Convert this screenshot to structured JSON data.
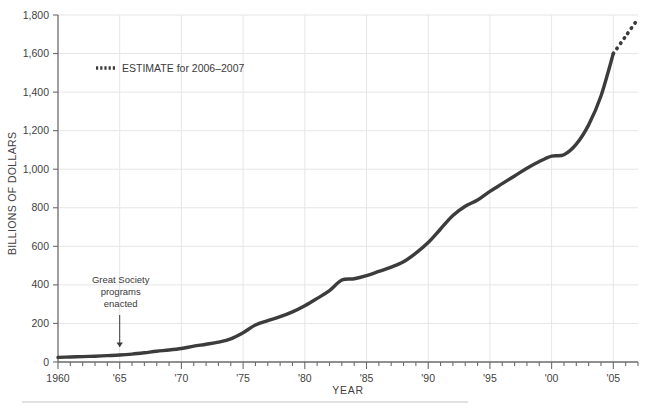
{
  "chart_data": {
    "type": "line",
    "title": "",
    "xlabel": "YEAR",
    "ylabel": "BILLIONS OF DOLLARS",
    "xlim": [
      1960,
      2007
    ],
    "ylim": [
      0,
      1800
    ],
    "grid": true,
    "legend_position": "upper-left-inside",
    "y_ticks": [
      0,
      200,
      400,
      600,
      800,
      1000,
      1200,
      1400,
      1600,
      1800
    ],
    "y_tick_labels": [
      "0",
      "200",
      "400",
      "600",
      "800",
      "1,000",
      "1,200",
      "1,400",
      "1,600",
      "1,800"
    ],
    "x_ticks": [
      1960,
      1965,
      1970,
      1975,
      1980,
      1985,
      1990,
      1995,
      2000,
      2005
    ],
    "x_tick_labels": [
      "1960",
      "'65",
      "'70",
      "'75",
      "'80",
      "'85",
      "'90",
      "'95",
      "'00",
      "'05"
    ],
    "x_minor_tick_step": 1,
    "series": [
      {
        "name": "Actual",
        "style": "solid",
        "color": "#3c3c3c",
        "x": [
          1960,
          1961,
          1962,
          1963,
          1964,
          1965,
          1966,
          1967,
          1968,
          1969,
          1970,
          1971,
          1972,
          1973,
          1974,
          1975,
          1976,
          1977,
          1978,
          1979,
          1980,
          1981,
          1982,
          1983,
          1984,
          1985,
          1986,
          1987,
          1988,
          1989,
          1990,
          1991,
          1992,
          1993,
          1994,
          1995,
          1996,
          1997,
          1998,
          1999,
          2000,
          2001,
          2002,
          2003,
          2004,
          2005
        ],
        "values": [
          24,
          26,
          28,
          30,
          33,
          36,
          41,
          48,
          56,
          62,
          70,
          82,
          92,
          103,
          120,
          152,
          192,
          215,
          235,
          260,
          292,
          330,
          370,
          425,
          432,
          448,
          470,
          492,
          520,
          565,
          620,
          690,
          760,
          808,
          840,
          885,
          925,
          965,
          1005,
          1040,
          1068,
          1075,
          1130,
          1230,
          1380,
          1600
        ]
      },
      {
        "name": "ESTIMATE for 2006-2007",
        "style": "dotted",
        "color": "#3c3c3c",
        "x": [
          2005,
          2006,
          2007
        ],
        "values": [
          1600,
          1690,
          1780
        ]
      }
    ],
    "legend": [
      {
        "label": "ESTIMATE for 2006–2007",
        "marker": "dotted-line",
        "color": "#3c3c3c"
      }
    ],
    "annotations": [
      {
        "name": "great-society-annotation",
        "lines": [
          "Great Society",
          "programs",
          "enacted"
        ],
        "points_to_year": 1965,
        "points_to_value": 36,
        "arrow": "down"
      }
    ],
    "colors": {
      "line": "#3c3c3c",
      "grid": "#e6e6e6",
      "axis": "#6b6b6b",
      "text": "#3a3a3a",
      "background": "#ffffff",
      "footer_rule": "#d8d8d8"
    }
  }
}
